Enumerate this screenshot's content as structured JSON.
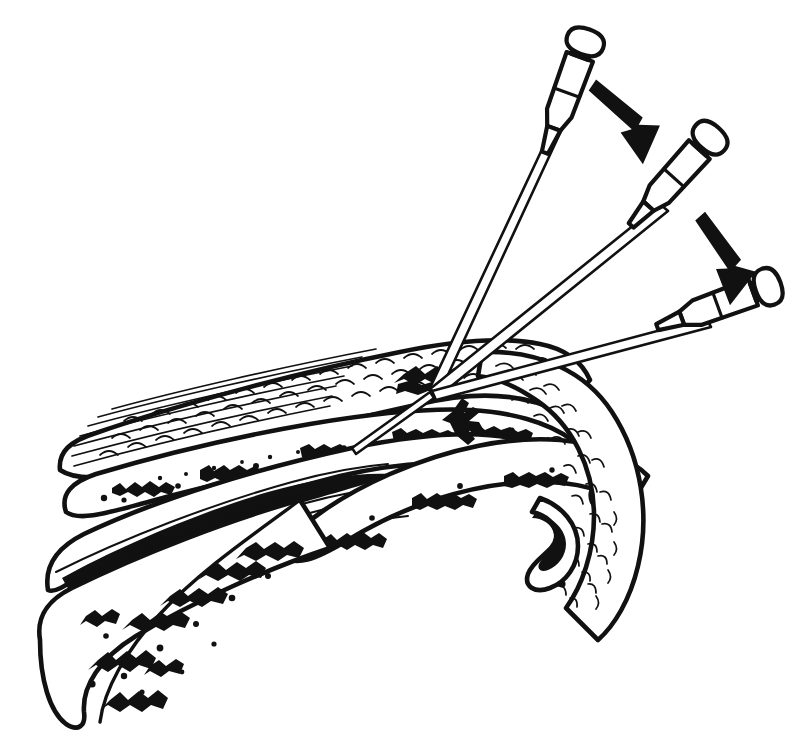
{
  "figure": {
    "subtitle": "Cross-sectional line drawing: three progressive needle angulations",
    "background_color": "#ffffff",
    "ink_color": "#111111",
    "width": 810,
    "height": 750
  },
  "instruments": [
    {
      "id": "needle-1",
      "label": "Needle 1 (steep, near-vertical approach)",
      "hub_label": "hub-flange-cap",
      "angle_degrees": 70,
      "hub_center_x": 575,
      "hub_center_y": 70,
      "tip_x": 434,
      "tip_y": 388
    },
    {
      "id": "needle-2",
      "label": "Needle 2 (intermediate oblique approach)",
      "hub_label": "hub-flange-cap",
      "angle_degrees": 48,
      "hub_center_x": 690,
      "hub_center_y": 160,
      "tip_x": 434,
      "tip_y": 388
    },
    {
      "id": "needle-3",
      "label": "Needle 3 (shallow, near-tangential approach)",
      "hub_label": "hub-flange-cap",
      "angle_degrees": 20,
      "hub_center_x": 740,
      "hub_center_y": 297,
      "tip_x": 434,
      "tip_y": 392
    }
  ],
  "arrows": [
    {
      "id": "arrow-1",
      "label": "Direction of angulation change, needle 1 to needle 2",
      "from_x": 592,
      "from_y": 84,
      "to_x": 660,
      "to_y": 148
    },
    {
      "id": "arrow-2",
      "label": "Direction of angulation change, needle 2 to needle 3",
      "from_x": 700,
      "from_y": 215,
      "to_x": 742,
      "to_y": 280
    }
  ],
  "anatomy": {
    "layers": [
      {
        "id": "skin",
        "label": "Skin / epidermis and dermis",
        "pattern": "scale-hatch"
      },
      {
        "id": "subcutaneous",
        "label": "Subcutaneous fat",
        "pattern": "coarse-speckle"
      },
      {
        "id": "fascia-tendon",
        "label": "Fascia and tendon fibers",
        "pattern": "parallel-fibers"
      },
      {
        "id": "deep-soft-tissue",
        "label": "Deep soft tissue / periosteum",
        "pattern": "coarse-speckle"
      },
      {
        "id": "bone",
        "label": "Cortical bone with cancellous marrow",
        "pattern": "trabecular-stipple"
      },
      {
        "id": "curved-structure",
        "label": "Curved adjacent structure (right)",
        "pattern": "fine-hatch"
      }
    ],
    "insertion_point": {
      "label": "Common needle entry point",
      "x": 434,
      "y": 386
    }
  }
}
